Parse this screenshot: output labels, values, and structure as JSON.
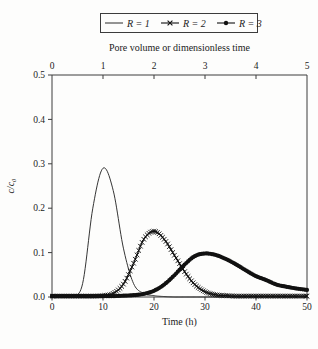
{
  "figure": {
    "background": "#fdfdfc",
    "ink": "#1b1b1b",
    "frame_color": "#3c3c3c"
  },
  "legend": {
    "entries": [
      {
        "label": "R = 1",
        "marker": "none",
        "line": "thin-solid"
      },
      {
        "label": "R = 2",
        "marker": "x",
        "line": "solid-with-x-markers"
      },
      {
        "label": "R = 3",
        "marker": "dot",
        "line": "solid-with-dot-markers"
      }
    ]
  },
  "chart_data": {
    "type": "line",
    "title": "",
    "x2label": "Pore volume or dimensionless time",
    "xlabel": "Time (h)",
    "ylabel": "c/c₀",
    "grid": false,
    "legend_position": "top-center-boxed",
    "x_axis": {
      "min": 0,
      "max": 50,
      "ticks": [
        "0",
        "10",
        "20",
        "30",
        "40",
        "50"
      ],
      "tick_values": [
        0,
        10,
        20,
        30,
        40,
        50
      ]
    },
    "top_axis": {
      "min": 0,
      "max": 5,
      "ticks": [
        "0",
        "1",
        "2",
        "3",
        "4",
        "5"
      ],
      "tick_values": [
        0,
        1,
        2,
        3,
        4,
        5
      ]
    },
    "y_axis": {
      "min": 0,
      "max": 0.5,
      "ticks": [
        "0.0",
        "0.1",
        "0.2",
        "0.3",
        "0.4",
        "0.5"
      ],
      "tick_values": [
        0,
        0.1,
        0.2,
        0.3,
        0.4,
        0.5
      ]
    },
    "x": [
      0,
      2,
      4,
      6,
      8,
      10,
      12,
      14,
      16,
      18,
      20,
      22,
      24,
      26,
      28,
      30,
      32,
      34,
      36,
      38,
      40,
      42,
      44,
      46,
      48,
      50
    ],
    "series": [
      {
        "name": "R = 1",
        "marker": "none",
        "peak": {
          "t": 10,
          "c": 0.29
        },
        "values": [
          0,
          0,
          0.002,
          0.03,
          0.2,
          0.29,
          0.24,
          0.11,
          0.03,
          0.008,
          0.003,
          0.001,
          0,
          0,
          0,
          0,
          0,
          0,
          0,
          0,
          0,
          0,
          0,
          0,
          0,
          0
        ]
      },
      {
        "name": "R = 2",
        "marker": "x",
        "peak": {
          "t": 20,
          "c": 0.148
        },
        "values": [
          0.002,
          0.002,
          0.002,
          0.002,
          0.002,
          0.003,
          0.008,
          0.029,
          0.076,
          0.13,
          0.148,
          0.13,
          0.094,
          0.057,
          0.028,
          0.012,
          0.005,
          0.003,
          0.002,
          0.002,
          0.002,
          0.002,
          0.002,
          0.002,
          0.002,
          0.002
        ]
      },
      {
        "name": "R = 3",
        "marker": "dot",
        "peak": {
          "t": 30,
          "c": 0.098
        },
        "values": [
          0.002,
          0.002,
          0.002,
          0.002,
          0.002,
          0.002,
          0.002,
          0.003,
          0.004,
          0.007,
          0.014,
          0.028,
          0.049,
          0.073,
          0.092,
          0.098,
          0.095,
          0.086,
          0.074,
          0.06,
          0.047,
          0.038,
          0.028,
          0.023,
          0.019,
          0.016
        ]
      }
    ]
  }
}
